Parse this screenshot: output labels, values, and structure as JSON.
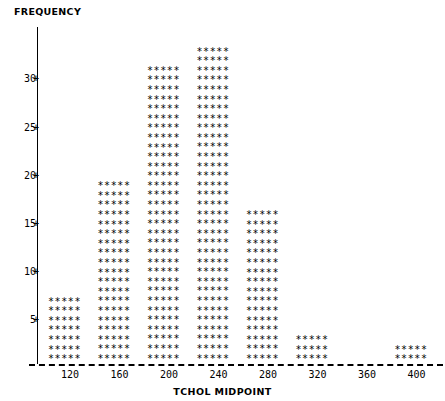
{
  "chart_data": {
    "type": "bar",
    "title": "",
    "subtitle": "",
    "xlabel": "TCHOL MIDPOINT",
    "ylabel": "FREQUENCY",
    "categories": [
      120,
      160,
      200,
      240,
      280,
      320,
      360,
      400
    ],
    "values": [
      7,
      19,
      31,
      33,
      16,
      3,
      0,
      2
    ],
    "x_tick_labels": [
      "120",
      "160",
      "200",
      "240",
      "280",
      "320",
      "360",
      "400"
    ],
    "y_tick_labels": [
      "5",
      "10",
      "15",
      "20",
      "25",
      "30"
    ],
    "y_tick_values": [
      5,
      10,
      15,
      20,
      25,
      30
    ],
    "xlim": [
      100,
      420
    ],
    "ylim": [
      0,
      33
    ],
    "grid": false,
    "legend": null,
    "marker_glyph": "*",
    "marker_per_row": 5
  },
  "axes": {
    "y_title": "FREQUENCY",
    "x_title": "TCHOL MIDPOINT",
    "y_ticks": [
      {
        "label": "30",
        "value": 30,
        "plus": "+"
      },
      {
        "label": "25",
        "value": 25,
        "plus": "+"
      },
      {
        "label": "20",
        "value": 20,
        "plus": "+"
      },
      {
        "label": "15",
        "value": 15,
        "plus": "+"
      },
      {
        "label": "10",
        "value": 10,
        "plus": "+"
      },
      {
        "label": "5",
        "value": 5,
        "plus": "+"
      }
    ],
    "x_ticks": [
      {
        "label": "120",
        "value": 120
      },
      {
        "label": "160",
        "value": 160
      },
      {
        "label": "200",
        "value": 200
      },
      {
        "label": "240",
        "value": 240
      },
      {
        "label": "280",
        "value": 280
      },
      {
        "label": "320",
        "value": 320
      },
      {
        "label": "360",
        "value": 360
      },
      {
        "label": "400",
        "value": 400
      }
    ]
  },
  "style": {
    "ink": "#000000",
    "paper": "#ffffff"
  },
  "bar_glyph_row": "*****"
}
